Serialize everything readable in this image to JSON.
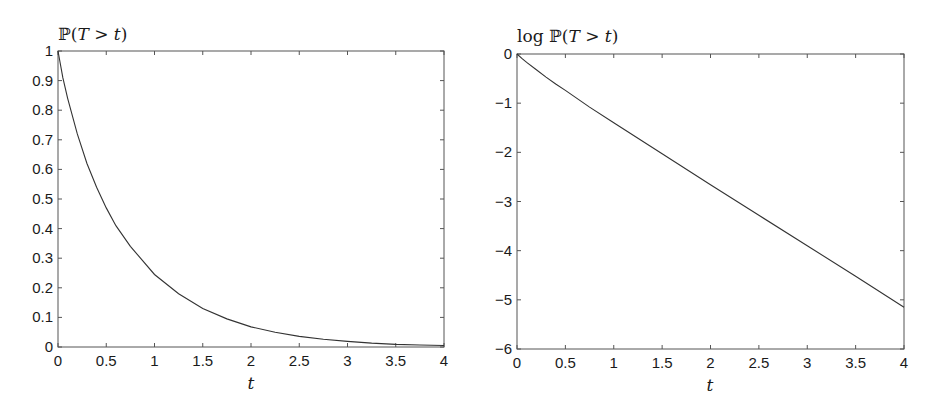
{
  "chart_data": [
    {
      "type": "line",
      "title": "ℙ(T > t)",
      "xlabel": "t",
      "ylabel": "ℙ(T > t)",
      "xlim": [
        0,
        4
      ],
      "ylim": [
        0,
        1
      ],
      "grid": false,
      "legend": null,
      "xticks": [
        "0",
        "0.5",
        "1",
        "1.5",
        "2",
        "2.5",
        "3",
        "3.5",
        "4"
      ],
      "yticks": [
        "0",
        "0.1",
        "0.2",
        "0.3",
        "0.4",
        "0.5",
        "0.6",
        "0.7",
        "0.8",
        "0.9",
        "1"
      ],
      "series": [
        {
          "name": "P(T>t)",
          "x": [
            0,
            0.05,
            0.1,
            0.2,
            0.3,
            0.4,
            0.5,
            0.6,
            0.75,
            1.0,
            1.25,
            1.5,
            1.75,
            2.0,
            2.25,
            2.5,
            2.75,
            3.0,
            3.25,
            3.5,
            3.75,
            4.0
          ],
          "values": [
            1.0,
            0.91,
            0.84,
            0.72,
            0.62,
            0.54,
            0.47,
            0.41,
            0.34,
            0.245,
            0.18,
            0.13,
            0.095,
            0.068,
            0.05,
            0.036,
            0.026,
            0.019,
            0.013,
            0.009,
            0.007,
            0.005
          ]
        }
      ]
    },
    {
      "type": "line",
      "title": "log ℙ(T > t)",
      "xlabel": "t",
      "ylabel": "log ℙ(T > t)",
      "xlim": [
        0,
        4
      ],
      "ylim": [
        -6,
        0
      ],
      "grid": false,
      "legend": null,
      "xticks": [
        "0",
        "0.5",
        "1",
        "1.5",
        "2",
        "2.5",
        "3",
        "3.5",
        "4"
      ],
      "yticks": [
        "−6",
        "−5",
        "−4",
        "−3",
        "−2",
        "−1",
        "0"
      ],
      "series": [
        {
          "name": "log P(T>t)",
          "x": [
            0,
            0.05,
            0.1,
            0.2,
            0.3,
            0.4,
            0.5,
            0.75,
            1.0,
            1.5,
            2.0,
            2.5,
            3.0,
            3.5,
            4.0
          ],
          "values": [
            0,
            -0.09,
            -0.17,
            -0.32,
            -0.47,
            -0.61,
            -0.74,
            -1.08,
            -1.4,
            -2.03,
            -2.66,
            -3.28,
            -3.9,
            -4.52,
            -5.15
          ]
        }
      ]
    }
  ],
  "left_plot": {
    "ylabel_prefix": "",
    "ylabel_bb": "ℙ",
    "ylabel_rest_open": "(",
    "ylabel_T": "T",
    "ylabel_gt": " > ",
    "ylabel_t": "t",
    "ylabel_close": ")",
    "xlabel": "t"
  },
  "right_plot": {
    "ylabel_prefix": "log ",
    "ylabel_bb": "ℙ",
    "ylabel_rest_open": "(",
    "ylabel_T": "T",
    "ylabel_gt": " > ",
    "ylabel_t": "t",
    "ylabel_close": ")",
    "xlabel": "t"
  },
  "colors": {
    "axis": "#555555",
    "line": "#333333",
    "text": "#1a1a1a"
  }
}
